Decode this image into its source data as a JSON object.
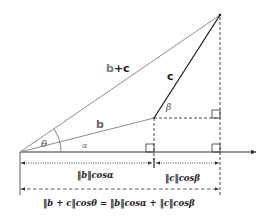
{
  "labels": {
    "sum_vector_b": "b",
    "sum_vector_plus_c": "+c",
    "vector_c": "c",
    "vector_b": "b",
    "angle_theta": "θ",
    "angle_alpha": "α",
    "angle_beta": "β",
    "proj_b": "‖b‖cosα",
    "proj_c": "‖c‖cosβ",
    "equation": "‖b + c‖cosθ = ‖b‖cosα + ‖c‖cosβ"
  },
  "colors": {
    "sum_vector": "#8c8c8c",
    "vector_b": "#8c8c8c",
    "vector_c": "#222222",
    "axis": "#333333",
    "dashed": "#333333",
    "text": "#222222",
    "label_b_gray": "#7a7a7a"
  }
}
